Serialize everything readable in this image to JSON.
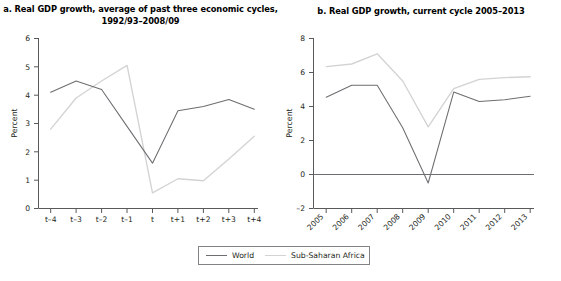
{
  "figure": {
    "background": "#ffffff",
    "legend": {
      "entries": [
        {
          "label": "World",
          "color": "#6d6e71",
          "style": "solid"
        },
        {
          "label": "Sub-Saharan Africa",
          "color": "#d3d3d3",
          "style": "solid"
        }
      ]
    }
  },
  "panel_a": {
    "title": "a. Real GDP growth, average of past three economic cycles, 1992/93–2008/09"
  },
  "panel_b": {
    "title": "b. Real GDP growth, current cycle 2005–2013"
  },
  "chart_data": [
    {
      "type": "line",
      "id": "panel-a",
      "title": "a. Real GDP growth, average of past three economic cycles, 1992/93–2008/09",
      "xlabel": "",
      "ylabel": "Percent",
      "categories": [
        "t–4",
        "t–3",
        "t–2",
        "t–1",
        "t",
        "t+1",
        "t+2",
        "t+3",
        "t+4"
      ],
      "xtick_labels": [
        "t–4",
        "t–3",
        "t–2",
        "t–1",
        "t",
        "t+1",
        "t+2",
        "t+3",
        "t+4"
      ],
      "ytick_labels": [
        "0",
        "1",
        "2",
        "3",
        "4",
        "5",
        "6"
      ],
      "yticks": [
        0,
        1,
        2,
        3,
        4,
        5,
        6
      ],
      "ylim": [
        0,
        6
      ],
      "grid": false,
      "legend_position": "bottom-center-shared",
      "series": [
        {
          "name": "World",
          "color": "#6d6e71",
          "values": [
            4.1,
            4.5,
            4.2,
            2.9,
            1.6,
            3.45,
            3.6,
            3.85,
            3.5
          ]
        },
        {
          "name": "Sub-Saharan Africa",
          "color": "#d3d3d3",
          "values": [
            2.8,
            3.9,
            4.5,
            5.05,
            0.55,
            1.05,
            0.98,
            1.75,
            2.55
          ]
        }
      ]
    },
    {
      "type": "line",
      "id": "panel-b",
      "title": "b. Real GDP growth, current cycle 2005–2013",
      "xlabel": "",
      "ylabel": "Percent",
      "categories": [
        "2005",
        "2006",
        "2007",
        "2008",
        "2009",
        "2010",
        "2011",
        "2012",
        "2013"
      ],
      "xtick_labels": [
        "2005",
        "2006",
        "2007",
        "2008",
        "2009",
        "2010",
        "2011",
        "2012",
        "2013"
      ],
      "ytick_labels": [
        "–2",
        "0",
        "2",
        "4",
        "6",
        "8"
      ],
      "yticks": [
        -2,
        0,
        2,
        4,
        6,
        8
      ],
      "ylim": [
        -2,
        8
      ],
      "grid": false,
      "zero_line": true,
      "legend_position": "bottom-center-shared",
      "series": [
        {
          "name": "World",
          "color": "#6d6e71",
          "values": [
            4.55,
            5.25,
            5.25,
            2.75,
            -0.5,
            4.85,
            4.3,
            4.4,
            4.6
          ]
        },
        {
          "name": "Sub-Saharan Africa",
          "color": "#d3d3d3",
          "values": [
            6.35,
            6.5,
            7.1,
            5.5,
            2.8,
            5.05,
            5.6,
            5.7,
            5.75
          ]
        }
      ]
    }
  ]
}
